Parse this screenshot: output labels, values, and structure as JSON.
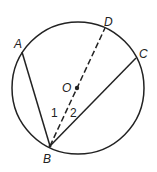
{
  "diagram": {
    "type": "circle-geometry",
    "circle": {
      "center_label": "O",
      "cx": 78,
      "cy": 88,
      "r": 66
    },
    "points": {
      "A": {
        "label": "A",
        "x": 22,
        "y": 52
      },
      "B": {
        "label": "B",
        "x": 50,
        "y": 146
      },
      "C": {
        "label": "C",
        "x": 136,
        "y": 58
      },
      "D": {
        "label": "D",
        "x": 105,
        "y": 28
      },
      "O": {
        "label": "O",
        "x": 77,
        "y": 88
      }
    },
    "segments": [
      {
        "from": "A",
        "to": "B",
        "style": "solid"
      },
      {
        "from": "B",
        "to": "C",
        "style": "solid"
      },
      {
        "from": "B",
        "to": "D",
        "style": "dashed",
        "through": "O"
      }
    ],
    "angle_labels": [
      {
        "label": "1",
        "x": 53,
        "y": 117
      },
      {
        "label": "2",
        "x": 70,
        "y": 117
      }
    ],
    "colors": {
      "stroke": "#222222",
      "background": "#ffffff"
    }
  }
}
